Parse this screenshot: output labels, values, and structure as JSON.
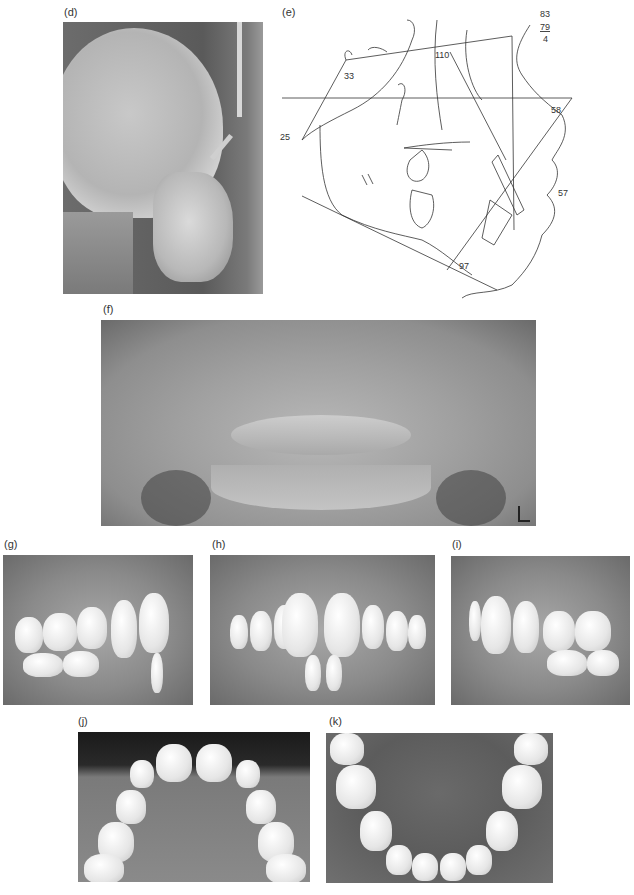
{
  "figure": {
    "panels": [
      {
        "id": "d",
        "label": "(d)",
        "description": "Lateral cephalometric radiograph"
      },
      {
        "id": "e",
        "label": "(e)",
        "description": "Cephalometric tracing"
      },
      {
        "id": "f",
        "label": "(f)",
        "description": "Panoramic radiograph",
        "marker": "L"
      },
      {
        "id": "g",
        "label": "(g)",
        "description": "Intraoral photo, right buccal"
      },
      {
        "id": "h",
        "label": "(h)",
        "description": "Intraoral photo, frontal"
      },
      {
        "id": "i",
        "label": "(i)",
        "description": "Intraoral photo, left buccal"
      },
      {
        "id": "j",
        "label": "(j)",
        "description": "Occlusal photo, maxillary arch"
      },
      {
        "id": "k",
        "label": "(k)",
        "description": "Occlusal photo, mandibular arch"
      }
    ],
    "tracing_values": {
      "v83": "83",
      "v79": "79",
      "v4": "4",
      "v110": "110",
      "v33": "33",
      "v58": "58",
      "v25": "25",
      "v57": "57",
      "v97": "97"
    }
  }
}
